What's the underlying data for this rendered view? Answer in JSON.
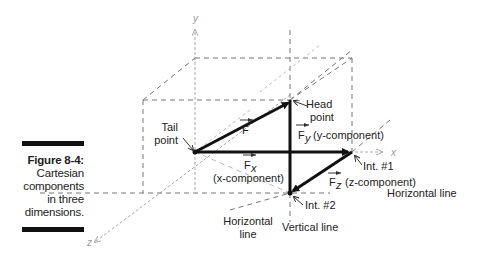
{
  "caption": {
    "title": "Figure 8-4:",
    "lines": [
      "Cartesian",
      "components",
      "in three",
      "dimensions."
    ]
  },
  "axes": {
    "x": "x",
    "y": "y",
    "z": "z"
  },
  "labels": {
    "tail_point": [
      "Tail",
      "point"
    ],
    "head_point": [
      "Head",
      "point"
    ],
    "force": "F",
    "fy": {
      "main": "F",
      "sub": "y",
      "desc": "(y-component)"
    },
    "fx": {
      "main": "F",
      "sub": "x",
      "desc": "(x-component)"
    },
    "fz": {
      "main": "F",
      "sub": "z",
      "desc": "(z-component)"
    },
    "int1": "Int. #1",
    "int2": "Int. #2",
    "horizontal_line_right": "Horizontal line",
    "horizontal_line_bottom": [
      "Horizontal",
      "line"
    ],
    "vertical_line": "Vertical line"
  },
  "colors": {
    "vector": "#111111",
    "dashed": "#777777",
    "axis": "#aaaaaa"
  }
}
